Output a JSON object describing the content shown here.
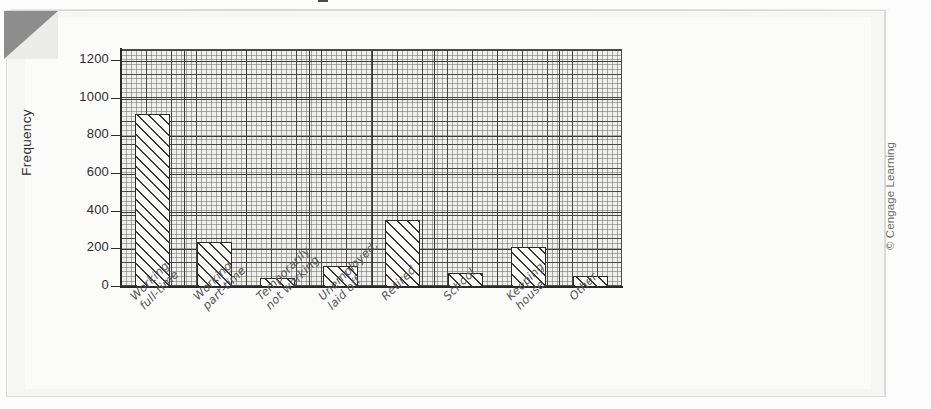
{
  "figure": {
    "title_fragment_visible": true,
    "credit": "© Cengage Learning"
  },
  "axis": {
    "y_label": "Frequency",
    "y_ticks": [
      "0",
      "200",
      "400",
      "600",
      "800",
      "1000",
      "1200"
    ]
  },
  "chart_data": {
    "type": "bar",
    "title": "",
    "xlabel": "",
    "ylabel": "Frequency",
    "ylim": [
      0,
      1250
    ],
    "yticks": [
      0,
      200,
      400,
      600,
      800,
      1000,
      1200
    ],
    "grid": true,
    "legend": "none",
    "categories": [
      "Working\nfull-time",
      "Working\npart-time",
      "Temporarily\nnot working",
      "Unemployed,\nlaid off",
      "Retired",
      "School",
      "Keeping\nhouse",
      "Other"
    ],
    "values": [
      918,
      239,
      48,
      111,
      356,
      74,
      212,
      58
    ]
  },
  "colors": {
    "bar_outline": "#2a2a2a",
    "bar_hatch": "#3a3a3a",
    "grid_major": "#3a3a3a",
    "grid_minor": "#6e6e6e",
    "plot_background": "#efefec",
    "paper": "#f6f6f4",
    "corner_fold": "#8d8d8d",
    "text": "#2d2d2d"
  }
}
